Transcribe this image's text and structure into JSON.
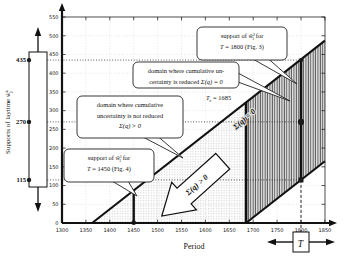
{
  "colors": {
    "ink": "#111111",
    "grid": "#bcbcbc",
    "refline": "#1a1a1a",
    "hatch_line": "#4a4a4a",
    "hatch_bg": "#e2e2e2",
    "dot_fill": "#9a9a9a",
    "white": "#ffffff"
  },
  "chart_data": {
    "type": "area",
    "xlabel": "Period",
    "ylabel_segs": [
      {
        "s": "Supports of laytime "
      },
      {
        "s": "ŵ",
        "i": true
      },
      {
        "s": "k",
        "sup": true
      },
      {
        "s": "j",
        "sub": true,
        "stack": true
      }
    ],
    "xlim": [
      1300,
      1850
    ],
    "ylim": [
      0,
      560
    ],
    "xticks": [
      1300,
      1350,
      1400,
      1450,
      1500,
      1550,
      1600,
      1650,
      1700,
      1750,
      1800,
      1850
    ],
    "yticks": [
      0,
      50,
      100,
      150,
      200,
      250,
      300,
      350,
      400,
      450,
      500,
      550
    ],
    "grid": true,
    "upper_support_boundary": {
      "x": [
        1363,
        1850
      ],
      "y": [
        0,
        487
      ]
    },
    "lower_support_boundary": {
      "x": [
        1685,
        1850
      ],
      "y": [
        0,
        165
      ]
    },
    "critical_period": 1685,
    "support_at_critical": [
      0,
      322
    ],
    "regions": [
      {
        "name": "cumulative-uncertainty-not-reduced",
        "label": "Σ(q) > 0",
        "fill": "dots",
        "x": [
          1363,
          1685,
          1685
        ],
        "y": [
          0,
          0,
          322
        ]
      },
      {
        "name": "cumulative-uncertainty-reduced",
        "label": "Σ(q) = 0",
        "fill": "hatch",
        "x": [
          1685,
          1685,
          1850,
          1850
        ],
        "y": [
          0,
          322,
          487,
          165
        ]
      }
    ],
    "support_T1800": {
      "T": 1800,
      "interval": [
        115,
        435
      ],
      "kernel": 270
    },
    "support_T1450": {
      "T": 1450,
      "interval": [
        0,
        87
      ]
    },
    "left_bar_values": [
      435,
      270,
      115
    ]
  },
  "annotations": {
    "callout_support_1800": {
      "line1": [
        {
          "s": "support of "
        },
        {
          "s": "ŵ",
          "i": true
        },
        {
          "s": "2",
          "sup": true
        },
        {
          "s": "1",
          "sub": true,
          "stack": true
        },
        {
          "s": " for"
        }
      ],
      "line2": [
        {
          "s": "T",
          "i": true
        },
        {
          "s": " = 1800 (Fig. 3)"
        }
      ]
    },
    "callout_domain_reduced": {
      "line1": [
        {
          "s": "domain where cumulative un-"
        }
      ],
      "line2": [
        {
          "s": "certainty is reduced "
        },
        {
          "s": "Σ(q) = 0",
          "i": true
        }
      ]
    },
    "tc_label": [
      {
        "s": "T",
        "i": true
      },
      {
        "s": "c",
        "sub": true
      },
      {
        "s": " = 1685"
      }
    ],
    "callout_domain_not_reduced": {
      "line1": [
        {
          "s": "domain where cumulative"
        }
      ],
      "line2": [
        {
          "s": "uncertainty is not reduced"
        }
      ],
      "line3": [
        {
          "s": "Σ(q) > 0",
          "i": true
        }
      ]
    },
    "callout_support_1450": {
      "line1": [
        {
          "s": "support of "
        },
        {
          "s": "ŵ",
          "i": true
        },
        {
          "s": "1",
          "sup": true
        },
        {
          "s": "1",
          "sub": true,
          "stack": true
        },
        {
          "s": " for"
        }
      ],
      "line2": [
        {
          "s": "T",
          "i": true
        },
        {
          "s": " = 1450 (Fig. 4)"
        }
      ]
    },
    "arrow_label": "Σ(q) > 0",
    "hatch_label": "Σ(q) = 0",
    "t_slider_label": "T"
  }
}
